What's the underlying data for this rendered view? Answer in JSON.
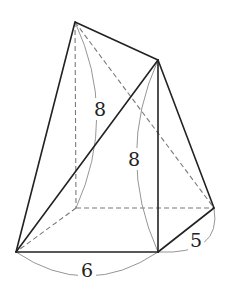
{
  "figure": {
    "type": "solid geometry diagram",
    "vertices": {
      "A": [
        75,
        22
      ],
      "B": [
        158,
        60
      ],
      "C": [
        16,
        252
      ],
      "D": [
        158,
        252
      ],
      "E": [
        214,
        208
      ],
      "F": [
        76,
        208
      ]
    },
    "solid_edges": [
      [
        "A",
        "B"
      ],
      [
        "A",
        "C"
      ],
      [
        "B",
        "C"
      ],
      [
        "B",
        "D"
      ],
      [
        "B",
        "E"
      ],
      [
        "C",
        "D"
      ],
      [
        "D",
        "E"
      ]
    ],
    "dashed_edges": [
      [
        "A",
        "F"
      ],
      [
        "A",
        "E"
      ],
      [
        "F",
        "C"
      ],
      [
        "F",
        "E"
      ]
    ],
    "labels": {
      "height_back": "8",
      "height_front": "8",
      "base_width": "6",
      "base_depth": "5"
    },
    "colors": {
      "line": "#222222",
      "dashed": "#7a7a7a",
      "brace": "#8a8a8a",
      "background": "#ffffff"
    }
  }
}
